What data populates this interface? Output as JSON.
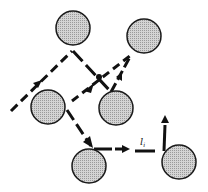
{
  "diagram": {
    "colors": {
      "particle_fill": "#c8c8c8",
      "particle_stroke": "#1a1a1a",
      "line": "#111111",
      "background": "#ffffff"
    },
    "particles": [
      {
        "id": "A",
        "name": "particle-top-center"
      },
      {
        "id": "B",
        "name": "particle-top-right"
      },
      {
        "id": "C",
        "name": "particle-left-middle"
      },
      {
        "id": "D",
        "name": "particle-center-right"
      },
      {
        "id": "E",
        "name": "particle-bottom-center"
      },
      {
        "id": "F",
        "name": "particle-bottom-right"
      }
    ],
    "label": {
      "symbol": "l",
      "subscript": "i"
    }
  }
}
